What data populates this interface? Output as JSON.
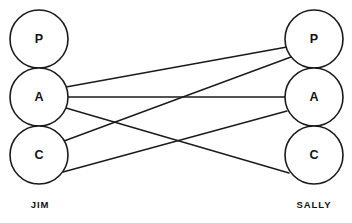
{
  "diagram": {
    "type": "transactional-analysis-ego-state-diagram",
    "background_color": "#ffffff",
    "stroke_color": "#1a1a1a",
    "text_color": "#111111",
    "width": 352,
    "height": 223
  },
  "people": [
    {
      "id": "jim",
      "name": "JIM",
      "side": "left",
      "label_x": 40,
      "label_y": 205,
      "circle_cx": 39,
      "circle_r": 29,
      "ego_states": [
        {
          "id": "jim-p",
          "label": "P",
          "full_name": "Parent",
          "cx": 39,
          "cy": 39
        },
        {
          "id": "jim-a",
          "label": "A",
          "full_name": "Adult",
          "cx": 39,
          "cy": 97
        },
        {
          "id": "jim-c",
          "label": "C",
          "full_name": "Child",
          "cx": 39,
          "cy": 155
        }
      ]
    },
    {
      "id": "sally",
      "name": "SALLY",
      "side": "right",
      "label_x": 314,
      "label_y": 205,
      "circle_cx": 314,
      "circle_r": 29,
      "ego_states": [
        {
          "id": "sally-p",
          "label": "P",
          "full_name": "Parent",
          "cx": 314,
          "cy": 39
        },
        {
          "id": "sally-a",
          "label": "A",
          "full_name": "Adult",
          "cx": 314,
          "cy": 97
        },
        {
          "id": "sally-c",
          "label": "C",
          "full_name": "Child",
          "cx": 314,
          "cy": 155
        }
      ]
    }
  ],
  "transactions": [
    {
      "id": "jim-a-to-sally-p",
      "from": "jim-a",
      "to": "sally-p",
      "from_label": "A",
      "to_label": "P",
      "x1": 66,
      "y1": 87,
      "x2": 287,
      "y2": 47
    },
    {
      "id": "jim-a-to-sally-a",
      "from": "jim-a",
      "to": "sally-a",
      "from_label": "A",
      "to_label": "A",
      "x1": 68,
      "y1": 97,
      "x2": 285,
      "y2": 97
    },
    {
      "id": "jim-a-to-sally-c",
      "from": "jim-a",
      "to": "sally-c",
      "from_label": "A",
      "to_label": "C",
      "x1": 66,
      "y1": 108,
      "x2": 289,
      "y2": 173
    },
    {
      "id": "jim-c-to-sally-p",
      "from": "jim-c",
      "to": "sally-p",
      "from_label": "C",
      "to_label": "P",
      "x1": 64,
      "y1": 141,
      "x2": 291,
      "y2": 57
    },
    {
      "id": "jim-c-to-sally-a",
      "from": "jim-c",
      "to": "sally-a",
      "from_label": "C",
      "to_label": "A",
      "x1": 63,
      "y1": 172,
      "x2": 287,
      "y2": 111
    }
  ]
}
